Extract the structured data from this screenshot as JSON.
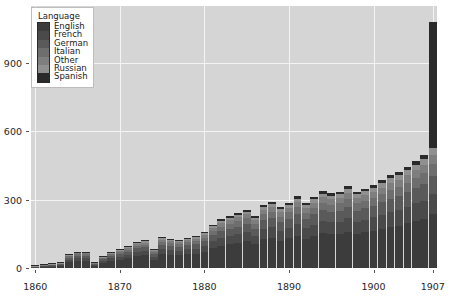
{
  "chart_data": {
    "type": "bar",
    "subtype": "stacked-bar",
    "title": "",
    "xlabel": "",
    "ylabel": "",
    "xlim": [
      1859.5,
      1907.5
    ],
    "ylim": [
      0,
      1150
    ],
    "grid": true,
    "x_ticks": [
      "1860",
      "1870",
      "1880",
      "1890",
      "1900",
      "1907"
    ],
    "x_tick_values": [
      1860,
      1870,
      1880,
      1890,
      1900,
      1907
    ],
    "y_ticks": [
      "0",
      "300",
      "600",
      "900"
    ],
    "y_tick_values": [
      0,
      300,
      600,
      900
    ],
    "legend": {
      "title": "Language",
      "position": "upper-left",
      "entries": [
        {
          "label": "English",
          "color": "#3c3c3c"
        },
        {
          "label": "French",
          "color": "#4a4a4a"
        },
        {
          "label": "German",
          "color": "#5a5a5a"
        },
        {
          "label": "Italian",
          "color": "#6e6e6e"
        },
        {
          "label": "Other",
          "color": "#7e7e7e"
        },
        {
          "label": "Russian",
          "color": "#909090"
        },
        {
          "label": "Spanish",
          "color": "#2a2a2a"
        }
      ]
    },
    "categories": [
      1860,
      1861,
      1862,
      1863,
      1864,
      1865,
      1866,
      1867,
      1868,
      1869,
      1870,
      1871,
      1872,
      1873,
      1874,
      1875,
      1876,
      1877,
      1878,
      1879,
      1880,
      1881,
      1882,
      1883,
      1884,
      1885,
      1886,
      1887,
      1888,
      1889,
      1890,
      1891,
      1892,
      1893,
      1894,
      1895,
      1896,
      1897,
      1898,
      1899,
      1900,
      1901,
      1902,
      1903,
      1904,
      1905,
      1906,
      1907
    ],
    "series": [
      {
        "name": "English",
        "color": "#3c3c3c",
        "values": [
          4,
          6,
          7,
          9,
          26,
          30,
          32,
          10,
          22,
          30,
          36,
          42,
          52,
          55,
          36,
          62,
          58,
          56,
          60,
          62,
          70,
          88,
          98,
          104,
          110,
          118,
          104,
          126,
          132,
          120,
          130,
          142,
          128,
          140,
          152,
          148,
          150,
          160,
          150,
          156,
          164,
          170,
          180,
          186,
          196,
          208,
          216,
          238
        ]
      },
      {
        "name": "French",
        "color": "#4a4a4a",
        "values": [
          2,
          3,
          4,
          5,
          10,
          13,
          12,
          5,
          9,
          12,
          14,
          16,
          18,
          20,
          14,
          22,
          20,
          20,
          22,
          22,
          26,
          30,
          34,
          36,
          38,
          40,
          36,
          44,
          46,
          42,
          46,
          50,
          46,
          50,
          54,
          52,
          54,
          58,
          54,
          56,
          58,
          62,
          66,
          68,
          72,
          76,
          80,
          88
        ]
      },
      {
        "name": "German",
        "color": "#5a5a5a",
        "values": [
          2,
          3,
          3,
          4,
          9,
          11,
          10,
          4,
          8,
          11,
          12,
          14,
          16,
          17,
          12,
          19,
          18,
          18,
          19,
          20,
          22,
          27,
          30,
          32,
          34,
          36,
          32,
          39,
          41,
          38,
          41,
          45,
          41,
          45,
          48,
          47,
          48,
          52,
          48,
          50,
          52,
          56,
          59,
          61,
          64,
          68,
          72,
          79
        ]
      },
      {
        "name": "Italian",
        "color": "#6e6e6e",
        "values": [
          1,
          2,
          2,
          3,
          6,
          7,
          7,
          3,
          5,
          7,
          8,
          9,
          11,
          11,
          8,
          13,
          12,
          12,
          13,
          13,
          15,
          18,
          20,
          21,
          23,
          24,
          21,
          26,
          27,
          25,
          27,
          30,
          27,
          30,
          32,
          31,
          32,
          34,
          32,
          33,
          35,
          37,
          39,
          41,
          43,
          45,
          48,
          53
        ]
      },
      {
        "name": "Other",
        "color": "#7e7e7e",
        "values": [
          1,
          1,
          2,
          2,
          4,
          5,
          5,
          2,
          4,
          5,
          6,
          7,
          8,
          8,
          6,
          9,
          9,
          9,
          9,
          10,
          11,
          13,
          15,
          16,
          17,
          18,
          16,
          19,
          20,
          19,
          20,
          22,
          20,
          22,
          24,
          23,
          24,
          26,
          24,
          25,
          26,
          28,
          30,
          31,
          32,
          34,
          36,
          40
        ]
      },
      {
        "name": "Russian",
        "color": "#909090",
        "values": [
          1,
          1,
          1,
          1,
          3,
          3,
          3,
          1,
          2,
          3,
          4,
          5,
          5,
          6,
          4,
          6,
          6,
          6,
          6,
          7,
          8,
          9,
          10,
          11,
          12,
          12,
          11,
          13,
          14,
          13,
          14,
          15,
          14,
          15,
          16,
          16,
          16,
          18,
          16,
          17,
          18,
          19,
          20,
          21,
          22,
          23,
          25,
          27
        ]
      },
      {
        "name": "Spanish",
        "color": "#2a2a2a",
        "values": [
          1,
          1,
          1,
          1,
          2,
          2,
          2,
          1,
          2,
          2,
          3,
          3,
          4,
          4,
          3,
          4,
          4,
          4,
          4,
          5,
          5,
          6,
          7,
          7,
          8,
          8,
          7,
          9,
          9,
          9,
          9,
          10,
          9,
          10,
          11,
          11,
          11,
          12,
          11,
          11,
          12,
          13,
          14,
          14,
          15,
          16,
          17,
          555
        ]
      }
    ],
    "totals": [
      12,
      17,
      20,
      25,
      60,
      71,
      71,
      26,
      52,
      70,
      83,
      96,
      114,
      121,
      83,
      135,
      127,
      125,
      133,
      139,
      157,
      191,
      214,
      227,
      242,
      256,
      227,
      276,
      289,
      266,
      287,
      314,
      285,
      312,
      337,
      328,
      335,
      360,
      335,
      348,
      365,
      385,
      408,
      422,
      444,
      470,
      494,
      1080
    ]
  }
}
